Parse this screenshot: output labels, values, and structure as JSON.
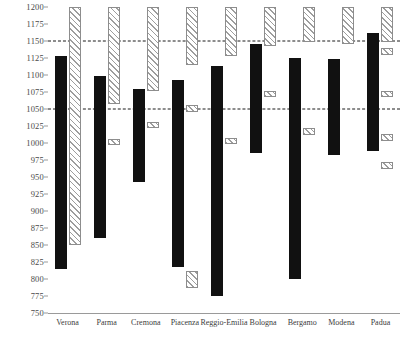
{
  "chart_data": {
    "type": "bar",
    "title": "",
    "xlabel": "",
    "ylabel": "",
    "ylim": [
      750,
      1200
    ],
    "grid": false,
    "legend": "none",
    "categories": [
      "Verona",
      "Parma",
      "Cremona",
      "Piacenza",
      "Reggio-Emilia",
      "Bologna",
      "Bergamo",
      "Modena",
      "Padua"
    ],
    "ytick_labels": [
      "1200",
      "1175",
      "1150",
      "1125",
      "1100",
      "1075",
      "1050",
      "1025",
      "1000",
      "975",
      "950",
      "925",
      "900",
      "875",
      "850",
      "825",
      "800",
      "775",
      "750"
    ],
    "ytick_values": [
      1200,
      1175,
      1150,
      1125,
      1100,
      1075,
      1050,
      1025,
      1000,
      975,
      950,
      925,
      900,
      875,
      850,
      825,
      800,
      775,
      750
    ],
    "reference_lines": [
      {
        "value": 1150,
        "style": "dashed",
        "color": "#1a1a1a"
      },
      {
        "value": 1050,
        "style": "dashed",
        "color": "#1a1a1a"
      }
    ],
    "series": [
      {
        "name": "solid-range",
        "style": "solid-black",
        "color": "#111111",
        "ranges": [
          {
            "category": "Verona",
            "low": 815,
            "high": 1128
          },
          {
            "category": "Parma",
            "low": 860,
            "high": 1098
          },
          {
            "category": "Cremona",
            "low": 942,
            "high": 1080
          },
          {
            "category": "Piacenza",
            "low": 818,
            "high": 1092
          },
          {
            "category": "Reggio-Emilia",
            "low": 775,
            "high": 1113
          },
          {
            "category": "Bologna",
            "low": 985,
            "high": 1146
          },
          {
            "category": "Bergamo",
            "low": 800,
            "high": 1125
          },
          {
            "category": "Modena",
            "low": 983,
            "high": 1124
          },
          {
            "category": "Padua",
            "low": 988,
            "high": 1162
          }
        ]
      },
      {
        "name": "hatched-segments",
        "style": "hatched",
        "color": "#9d9d9d",
        "segments": [
          {
            "category": "Verona",
            "low": 850,
            "high": 1200
          },
          {
            "category": "Parma",
            "low": 1057,
            "high": 1200
          },
          {
            "category": "Parma",
            "low": 997,
            "high": 1006
          },
          {
            "category": "Cremona",
            "low": 1077,
            "high": 1200
          },
          {
            "category": "Cremona",
            "low": 1022,
            "high": 1031
          },
          {
            "category": "Piacenza",
            "low": 1115,
            "high": 1200
          },
          {
            "category": "Piacenza",
            "low": 1046,
            "high": 1056
          },
          {
            "category": "Piacenza",
            "low": 787,
            "high": 812
          },
          {
            "category": "Reggio-Emilia",
            "low": 1128,
            "high": 1200
          },
          {
            "category": "Reggio-Emilia",
            "low": 998,
            "high": 1007
          },
          {
            "category": "Bologna",
            "low": 1142,
            "high": 1200
          },
          {
            "category": "Bologna",
            "low": 1067,
            "high": 1076
          },
          {
            "category": "Bergamo",
            "low": 1148,
            "high": 1200
          },
          {
            "category": "Bergamo",
            "low": 1012,
            "high": 1022
          },
          {
            "category": "Modena",
            "low": 1146,
            "high": 1200
          },
          {
            "category": "Padua",
            "low": 1148,
            "high": 1200
          },
          {
            "category": "Padua",
            "low": 1129,
            "high": 1140
          },
          {
            "category": "Padua",
            "low": 1067,
            "high": 1077
          },
          {
            "category": "Padua",
            "low": 1003,
            "high": 1013
          },
          {
            "category": "Padua",
            "low": 962,
            "high": 972
          }
        ]
      }
    ]
  }
}
